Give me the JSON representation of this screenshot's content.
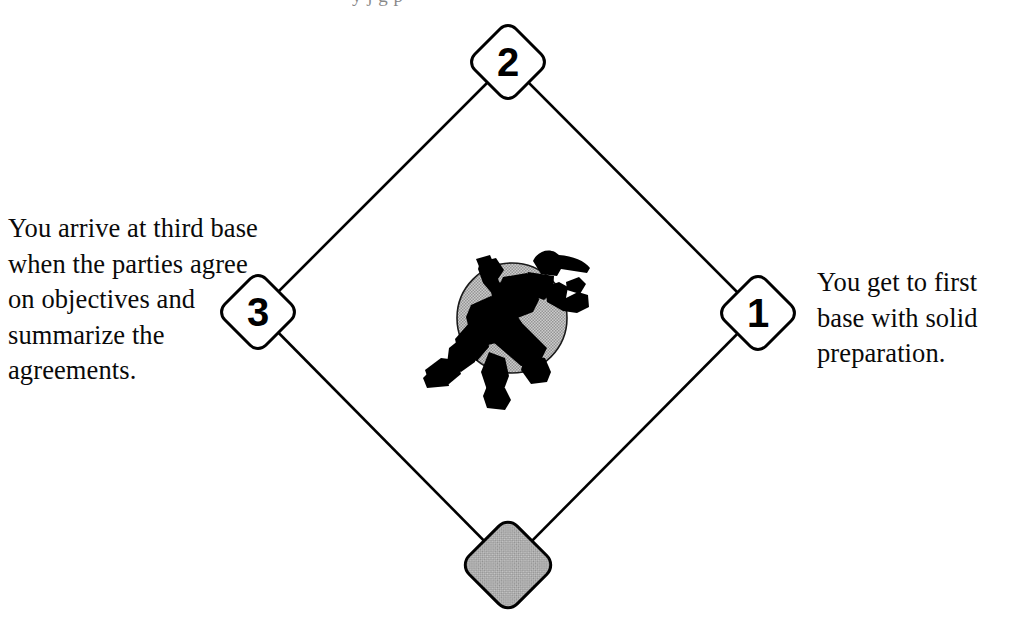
{
  "diagram": {
    "background_color": "#ffffff",
    "line_color": "#000000",
    "base_fill": "#ffffff",
    "home_plate_fill": "#b2b2b2",
    "runner_circle_fill": "#b5b5b5",
    "runner_silhouette_color": "#000000"
  },
  "top_edge_artifact": {
    "visible_fragment": "y j g p"
  },
  "bases": [
    {
      "id": "base-1",
      "label": "1",
      "position": "right",
      "cx": 758,
      "cy": 313,
      "size": 58,
      "fill": "#ffffff"
    },
    {
      "id": "base-2",
      "label": "2",
      "position": "top",
      "cx": 508,
      "cy": 62,
      "size": 58,
      "fill": "#ffffff"
    },
    {
      "id": "base-3",
      "label": "3",
      "position": "left",
      "cx": 258,
      "cy": 312,
      "size": 58,
      "fill": "#ffffff"
    },
    {
      "id": "home-plate",
      "label": "",
      "position": "bottom",
      "cx": 508,
      "cy": 565,
      "size": 68,
      "fill": "#b2b2b2"
    }
  ],
  "callouts": {
    "left": {
      "id": "third-base-callout",
      "text": "You arrive at third base when the parties agree on objectives and summarize the agreements."
    },
    "right": {
      "id": "first-base-callout",
      "text": "You get to first base with solid preparation."
    }
  },
  "center_graphic": {
    "name": "baseball-runner-icon",
    "description": "Black silhouette of a baseball player running, wearing a cap, over a gray circle",
    "circle_cx": 512,
    "circle_cy": 318,
    "circle_r": 55
  }
}
